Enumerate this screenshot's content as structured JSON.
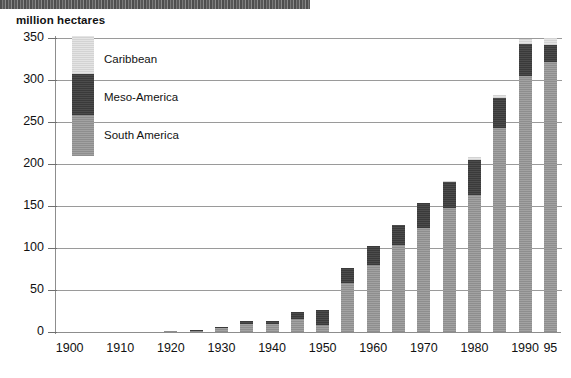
{
  "header": {
    "strip_present": true
  },
  "axis": {
    "y_title": "million hectares",
    "y_ticks": [
      "350",
      "300",
      "250",
      "200",
      "150",
      "100",
      "50",
      "0"
    ],
    "x_ticks": [
      "1900",
      "1910",
      "1920",
      "1930",
      "1940",
      "1950",
      "1960",
      "1970",
      "1980",
      "1990",
      "95"
    ]
  },
  "legend": {
    "items": [
      {
        "label": "Caribbean",
        "color": "#dcdcdc"
      },
      {
        "label": "Meso-America",
        "color": "#434343"
      },
      {
        "label": "South America",
        "color": "#969696"
      }
    ]
  },
  "chart_data": {
    "type": "bar",
    "stacked": true,
    "title": "",
    "subtitle": "",
    "xlabel": "",
    "ylabel": "million hectares",
    "ylim": [
      0,
      350
    ],
    "ytick_step": 50,
    "grid": true,
    "legend_position": "inside-top-left",
    "categories": [
      "1900",
      "1905",
      "1910",
      "1915",
      "1920",
      "1925",
      "1930",
      "1935",
      "1940",
      "1945",
      "1950",
      "1955",
      "1960",
      "1965",
      "1970",
      "1975",
      "1980",
      "1985",
      "1990",
      "1995"
    ],
    "series": [
      {
        "name": "South America",
        "color": "#969696",
        "values": [
          0,
          0,
          0,
          0,
          1,
          1.5,
          5,
          9,
          9,
          15,
          8,
          58,
          80,
          104,
          124,
          148,
          163,
          243,
          305,
          322
        ]
      },
      {
        "name": "Meso-America",
        "color": "#434343",
        "values": [
          0,
          0,
          0,
          0,
          0.5,
          0.5,
          1.5,
          4.5,
          4.5,
          9,
          18,
          18,
          22,
          23,
          29,
          30,
          42,
          36,
          38,
          20
        ]
      },
      {
        "name": "Caribbean",
        "color": "#dcdcdc",
        "values": [
          0,
          0,
          0,
          0,
          0,
          0,
          0,
          0,
          0,
          0,
          0,
          0,
          0,
          0,
          0,
          1.5,
          3,
          3,
          6,
          8
        ]
      }
    ],
    "totals": [
      0,
      0,
      0,
      0,
      1.5,
      2,
      6.5,
      13.5,
      13.5,
      24,
      26,
      76,
      102,
      127,
      153,
      179.5,
      208,
      282,
      349,
      350
    ]
  }
}
